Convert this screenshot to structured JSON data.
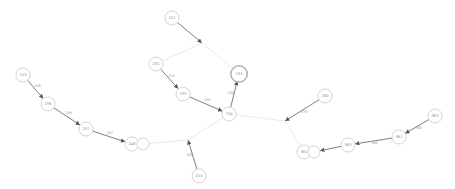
{
  "graph": {
    "nodes": [
      {
        "id": "n251",
        "label": "251",
        "x": 172,
        "y": 18,
        "r": 7
      },
      {
        "id": "n232",
        "label": "232",
        "x": 156,
        "y": 64,
        "r": 7
      },
      {
        "id": "n233",
        "label": "233",
        "x": 183,
        "y": 94,
        "r": 7
      },
      {
        "id": "n235",
        "label": "235",
        "x": 239,
        "y": 74,
        "r": 7,
        "highlight": true
      },
      {
        "id": "n234",
        "label": "234",
        "x": 229,
        "y": 114,
        "r": 7
      },
      {
        "id": "n253",
        "label": "253",
        "x": 23,
        "y": 75,
        "r": 7
      },
      {
        "id": "n236",
        "label": "236",
        "x": 48,
        "y": 104,
        "r": 7
      },
      {
        "id": "n237",
        "label": "237",
        "x": 86,
        "y": 129,
        "r": 7
      },
      {
        "id": "n246",
        "label": "246",
        "x": 132,
        "y": 144,
        "r": 7
      },
      {
        "id": "n246b",
        "label": "",
        "x": 143,
        "y": 144,
        "r": 6
      },
      {
        "id": "n255",
        "label": "255",
        "x": 199,
        "y": 176,
        "r": 7
      },
      {
        "id": "n280",
        "label": "280",
        "x": 325,
        "y": 96,
        "r": 7
      },
      {
        "id": "n361",
        "label": "361",
        "x": 304,
        "y": 152,
        "r": 7
      },
      {
        "id": "n361b",
        "label": "",
        "x": 314,
        "y": 152,
        "r": 6
      },
      {
        "id": "n363",
        "label": "363",
        "x": 435,
        "y": 116,
        "r": 7
      },
      {
        "id": "n362",
        "label": "362",
        "x": 399,
        "y": 137,
        "r": 7
      },
      {
        "id": "n360",
        "label": "360",
        "x": 348,
        "y": 145,
        "r": 7
      }
    ],
    "junctions": [
      {
        "id": "j1",
        "x": 202,
        "y": 43
      },
      {
        "id": "j2",
        "x": 285,
        "y": 121
      },
      {
        "id": "j3",
        "x": 188,
        "y": 140
      }
    ],
    "edges": [
      {
        "from": "n251",
        "to": "j1",
        "type": "heavy",
        "label": ""
      },
      {
        "from": "j1",
        "to": "n232",
        "type": "light",
        "label": ""
      },
      {
        "from": "j1",
        "to": "n235",
        "type": "light",
        "label": ""
      },
      {
        "from": "n232",
        "to": "n233",
        "type": "heavy",
        "label": "232"
      },
      {
        "from": "n233",
        "to": "n234",
        "type": "heavy",
        "label": "233"
      },
      {
        "from": "n234",
        "to": "n235",
        "type": "heavy",
        "label": "234"
      },
      {
        "from": "n253",
        "to": "n236",
        "type": "heavy",
        "label": "235"
      },
      {
        "from": "n236",
        "to": "n237",
        "type": "heavy",
        "label": "236"
      },
      {
        "from": "n237",
        "to": "n246",
        "type": "heavy",
        "label": "237"
      },
      {
        "from": "n234",
        "to": "j3",
        "type": "light",
        "label": ""
      },
      {
        "from": "j3",
        "to": "n246b",
        "type": "light",
        "label": ""
      },
      {
        "from": "n255",
        "to": "j3",
        "type": "heavy",
        "label": "255"
      },
      {
        "from": "n234",
        "to": "j2",
        "type": "light",
        "label": ""
      },
      {
        "from": "n280",
        "to": "j2",
        "type": "heavy",
        "label": "279"
      },
      {
        "from": "j2",
        "to": "n361",
        "type": "light",
        "label": ""
      },
      {
        "from": "n363",
        "to": "n362",
        "type": "heavy",
        "label": "362"
      },
      {
        "from": "n362",
        "to": "n360",
        "type": "heavy",
        "label": "364"
      },
      {
        "from": "n360",
        "to": "n361b",
        "type": "heavy",
        "label": ""
      }
    ]
  },
  "colors": {
    "background": "#ffffff",
    "node_stroke": "#c8c8c8",
    "heavy_edge": "#707070",
    "light_edge": "#e0e0e0",
    "text": "#8a8a8a"
  }
}
